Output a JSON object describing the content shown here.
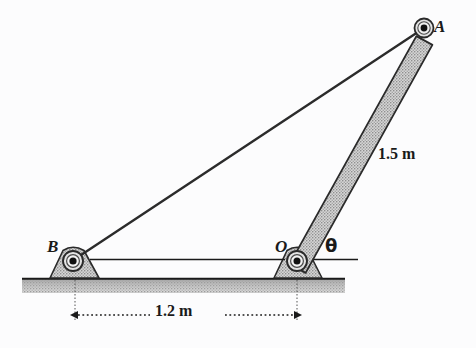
{
  "figure": {
    "background_color": "#fcfcfd",
    "ink_color": "#1a1a1a",
    "hatch_fill_color": "#b8b8b8",
    "width": 476,
    "height": 348
  },
  "labels": {
    "point_a": "A",
    "point_b": "B",
    "point_o": "O",
    "angle_theta": "θ",
    "length_oa": "1.5 m",
    "length_ob": "1.2 m"
  },
  "geometry": {
    "pin_a": {
      "x": 424,
      "y": 28,
      "r_outer": 9,
      "r_inner": 3.5
    },
    "pin_o": {
      "x": 297,
      "y": 261,
      "r_outer": 9,
      "r_inner": 3.5
    },
    "pin_b": {
      "x": 73,
      "y": 261,
      "r_outer": 9,
      "r_inner": 3.5
    },
    "bar_oa_half_width": 7.5,
    "cable_ba_width": 2,
    "ground": {
      "x1": 22,
      "x2": 345,
      "y_top": 278,
      "y_bottom": 293
    },
    "reference_line": {
      "x1": 90,
      "x2": 358,
      "y": 259
    },
    "dimension_line": {
      "x1": 75,
      "x2": 297,
      "y": 315
    },
    "support_b": {
      "base_left": 50,
      "base_right": 99,
      "apex_left": 64,
      "apex_right": 85,
      "base_y": 278,
      "apex_y": 248
    },
    "support_o": {
      "base_left": 274,
      "base_right": 322,
      "apex_left": 288,
      "apex_right": 308,
      "base_y": 278,
      "apex_y": 248
    }
  },
  "measurements": {
    "bar_oa_length_m": 1.5,
    "distance_ob_m": 1.2,
    "angle_symbol": "θ"
  }
}
